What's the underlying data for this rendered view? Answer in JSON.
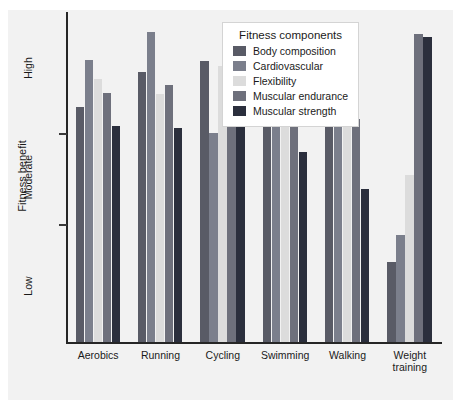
{
  "chart_data": {
    "type": "bar",
    "title": "",
    "xlabel": "",
    "ylabel": "Fitness benefit",
    "categories": [
      "Aerobics",
      "Running",
      "Cycling",
      "Swimming",
      "Walking",
      "Weight\ntraining"
    ],
    "ytick_labels": [
      "High",
      "Moderate",
      "Low"
    ],
    "ylim": [
      0,
      3
    ],
    "grid": false,
    "legend_title": "Fitness components",
    "legend_position": "top-center",
    "series": [
      {
        "name": "Body composition",
        "color": "#595b66",
        "values": [
          2.15,
          2.47,
          2.57,
          2.59,
          2.05,
          0.73
        ]
      },
      {
        "name": "Cardiovascular",
        "color": "#7b7f8c",
        "values": [
          2.58,
          2.84,
          1.91,
          2.73,
          2.32,
          0.98
        ]
      },
      {
        "name": "Flexibility",
        "color": "#dcdcdc",
        "values": [
          2.41,
          2.27,
          2.52,
          2.48,
          2.19,
          1.53
        ]
      },
      {
        "name": "Muscular endurance",
        "color": "#6e707c",
        "values": [
          2.28,
          2.35,
          2.09,
          2.07,
          2.04,
          2.82
        ]
      },
      {
        "name": "Muscular strength",
        "color": "#2b2f3d",
        "values": [
          1.98,
          1.96,
          2.08,
          1.74,
          1.4,
          2.79
        ]
      }
    ]
  }
}
